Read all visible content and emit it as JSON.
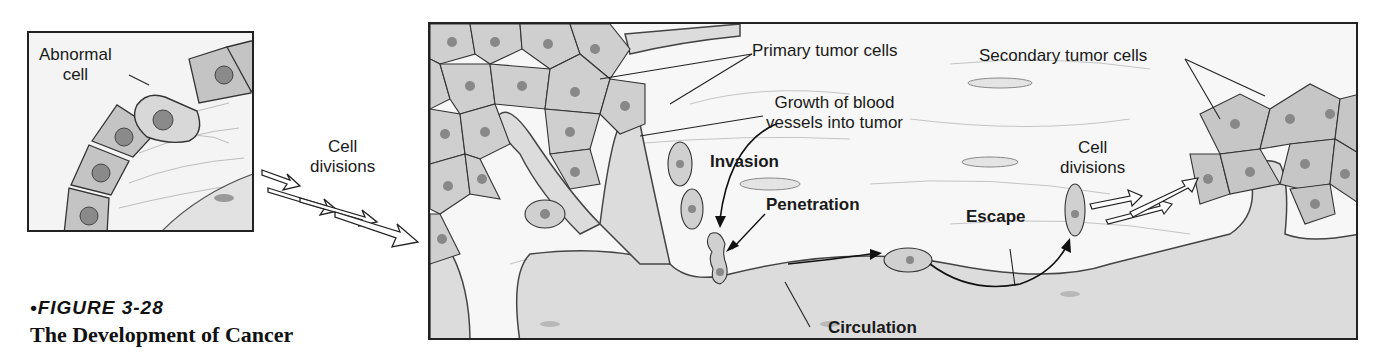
{
  "figure": {
    "number": "•FIGURE 3-28",
    "title": "The Development of Cancer"
  },
  "left_panel": {
    "labels": {
      "abnormal_cell": "Abnormal\ncell"
    }
  },
  "between_panels": {
    "cell_divisions_1": "Cell\ndivisions"
  },
  "main_panel": {
    "labels": {
      "primary_tumor_cells": "Primary tumor cells",
      "growth_blood_vessels": "Growth of blood\nvessels into tumor",
      "invasion": "Invasion",
      "penetration": "Penetration",
      "circulation": "Circulation",
      "escape": "Escape",
      "cell_divisions_2": "Cell\ndivisions",
      "secondary_tumor_cells": "Secondary tumor cells"
    }
  },
  "colors": {
    "cell_fill": "#c9c9c9",
    "nucleus": "#8a8a8a",
    "vessel": "#d6d6d6",
    "tissue_bg": "#f4f4f4",
    "outline": "#333333"
  }
}
